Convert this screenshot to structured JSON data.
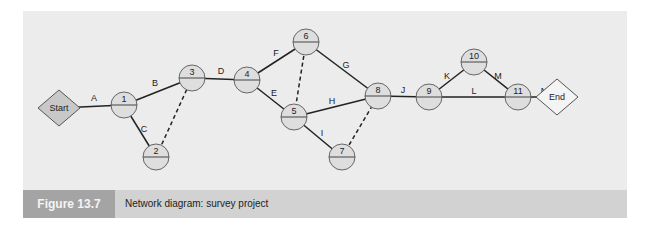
{
  "figure": {
    "label": "Figure 13.7",
    "title": "Network diagram: survey project"
  },
  "colors": {
    "panel": "#ececec",
    "caption_bar": "#d2d2d2",
    "label_box": "#a4a4a4",
    "start_fill": "#c8c8c8",
    "end_fill": "#f4f4f4",
    "node_fill": "#dedede"
  },
  "terminals": [
    {
      "id": "start",
      "label": "Start",
      "x": 59,
      "y": 108
    },
    {
      "id": "end",
      "label": "End",
      "x": 557,
      "y": 97
    }
  ],
  "nodes": [
    {
      "id": "1",
      "label": "1",
      "x": 124,
      "y": 105
    },
    {
      "id": "2",
      "label": "2",
      "x": 156,
      "y": 157
    },
    {
      "id": "3",
      "label": "3",
      "x": 192,
      "y": 78
    },
    {
      "id": "4",
      "label": "4",
      "x": 247,
      "y": 80
    },
    {
      "id": "5",
      "label": "5",
      "x": 294,
      "y": 117
    },
    {
      "id": "6",
      "label": "6",
      "x": 306,
      "y": 42
    },
    {
      "id": "7",
      "label": "7",
      "x": 342,
      "y": 157
    },
    {
      "id": "8",
      "label": "8",
      "x": 378,
      "y": 96
    },
    {
      "id": "9",
      "label": "9",
      "x": 429,
      "y": 97
    },
    {
      "id": "10",
      "label": "10",
      "x": 474,
      "y": 62
    },
    {
      "id": "11",
      "label": "11",
      "x": 518,
      "y": 97
    }
  ],
  "activities": [
    {
      "label": "A",
      "from": "start",
      "to": "1",
      "dummy": false,
      "lx": 94,
      "ly": 101
    },
    {
      "label": "B",
      "from": "1",
      "to": "3",
      "dummy": false,
      "lx": 155,
      "ly": 86
    },
    {
      "label": "C",
      "from": "1",
      "to": "2",
      "dummy": false,
      "lx": 144,
      "ly": 132
    },
    {
      "label": "",
      "from": "2",
      "to": "3",
      "dummy": true
    },
    {
      "label": "D",
      "from": "3",
      "to": "4",
      "dummy": false,
      "lx": 221,
      "ly": 74
    },
    {
      "label": "F",
      "from": "4",
      "to": "6",
      "dummy": false,
      "lx": 276,
      "ly": 56
    },
    {
      "label": "E",
      "from": "4",
      "to": "5",
      "dummy": false,
      "lx": 274,
      "ly": 96
    },
    {
      "label": "",
      "from": "6",
      "to": "5",
      "dummy": true
    },
    {
      "label": "G",
      "from": "6",
      "to": "8",
      "dummy": false,
      "lx": 346,
      "ly": 68
    },
    {
      "label": "H",
      "from": "5",
      "to": "8",
      "dummy": false,
      "lx": 332,
      "ly": 104
    },
    {
      "label": "I",
      "from": "5",
      "to": "7",
      "dummy": false,
      "lx": 322,
      "ly": 136
    },
    {
      "label": "",
      "from": "7",
      "to": "8",
      "dummy": true
    },
    {
      "label": "J",
      "from": "8",
      "to": "9",
      "dummy": false,
      "lx": 403,
      "ly": 93
    },
    {
      "label": "K",
      "from": "9",
      "to": "10",
      "dummy": false,
      "lx": 447,
      "ly": 79
    },
    {
      "label": "M",
      "from": "10",
      "to": "11",
      "dummy": false,
      "lx": 498,
      "ly": 79
    },
    {
      "label": "L",
      "from": "9",
      "to": "11",
      "dummy": false,
      "lx": 474,
      "ly": 94
    },
    {
      "label": "N",
      "from": "11",
      "to": "end",
      "dummy": false,
      "lx": 544,
      "ly": 94
    }
  ]
}
